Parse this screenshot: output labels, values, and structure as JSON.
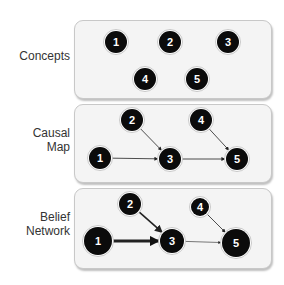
{
  "panels": [
    {
      "label_lines": [
        "Concepts"
      ],
      "nodes": [
        {
          "id": "1",
          "x": 116,
          "y": 42,
          "r": 11
        },
        {
          "id": "2",
          "x": 170,
          "y": 42,
          "r": 11
        },
        {
          "id": "3",
          "x": 228,
          "y": 42,
          "r": 11
        },
        {
          "id": "4",
          "x": 145,
          "y": 79,
          "r": 11
        },
        {
          "id": "5",
          "x": 197,
          "y": 79,
          "r": 11
        }
      ],
      "edges": []
    },
    {
      "label_lines": [
        "Causal",
        "Map"
      ],
      "nodes": [
        {
          "id": "2",
          "x": 132,
          "y": 120,
          "r": 11
        },
        {
          "id": "4",
          "x": 201,
          "y": 120,
          "r": 11
        },
        {
          "id": "1",
          "x": 100,
          "y": 158,
          "r": 11
        },
        {
          "id": "3",
          "x": 170,
          "y": 159,
          "r": 11
        },
        {
          "id": "5",
          "x": 237,
          "y": 159,
          "r": 11
        }
      ],
      "edges": [
        {
          "from": "1",
          "to": "3",
          "weight": 0.8
        },
        {
          "from": "2",
          "to": "3",
          "weight": 0.8
        },
        {
          "from": "3",
          "to": "5",
          "weight": 0.8
        },
        {
          "from": "4",
          "to": "5",
          "weight": 0.8
        }
      ]
    },
    {
      "label_lines": [
        "Belief",
        "Network"
      ],
      "nodes": [
        {
          "id": "2",
          "x": 130,
          "y": 204,
          "r": 11
        },
        {
          "id": "4",
          "x": 200,
          "y": 207,
          "r": 9
        },
        {
          "id": "1",
          "x": 98,
          "y": 241,
          "r": 14
        },
        {
          "id": "3",
          "x": 172,
          "y": 241,
          "r": 12
        },
        {
          "id": "5",
          "x": 236,
          "y": 243,
          "r": 14
        }
      ],
      "edges": [
        {
          "from": "1",
          "to": "3",
          "weight": 3
        },
        {
          "from": "2",
          "to": "3",
          "weight": 1.6
        },
        {
          "from": "3",
          "to": "5",
          "weight": 0.6
        },
        {
          "from": "4",
          "to": "5",
          "weight": 0.8
        }
      ]
    }
  ],
  "colors": {
    "node_fill": "#0b0b0b",
    "node_text": "#ffffff",
    "edge": "#222222",
    "panel_bg": "#f4f4f4"
  }
}
